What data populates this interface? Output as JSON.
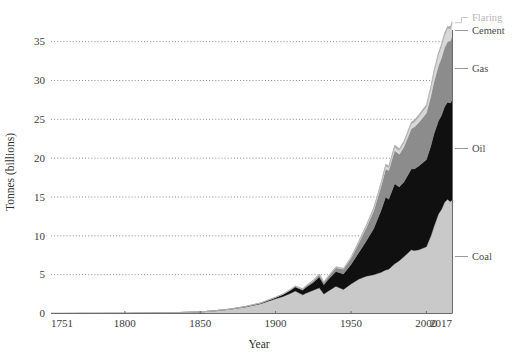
{
  "chart_data": {
    "type": "area",
    "title": "",
    "subtitle": "",
    "xlabel": "Year",
    "ylabel": "Tonnes (billions)",
    "stacked": true,
    "grid": true,
    "legend_position": "right-inline",
    "xlim": [
      1751,
      2017
    ],
    "ylim": [
      0,
      36.5
    ],
    "yticks": [
      0,
      5,
      10,
      15,
      20,
      25,
      30,
      35
    ],
    "ytick_labels": [
      "0",
      "5",
      "10",
      "15",
      "20",
      "25",
      "30",
      "35"
    ],
    "xticks": [
      1751,
      1800,
      1850,
      1900,
      1950,
      2000,
      2017
    ],
    "xtick_labels": [
      "1751",
      "1800",
      "1850",
      "1900",
      "1950",
      "2000",
      "2017"
    ],
    "colors": {
      "coal": "#c9c9c9",
      "oil": "#101010",
      "gas": "#8c8c8c",
      "cement": "#d8d8d8",
      "flaring": "#a8a8a8",
      "axis": "#6b6b6b",
      "grid": "#6f6f6f",
      "text": "#3a3a3a"
    },
    "x": [
      1751,
      1760,
      1770,
      1780,
      1790,
      1800,
      1810,
      1820,
      1830,
      1840,
      1850,
      1860,
      1870,
      1880,
      1890,
      1900,
      1905,
      1910,
      1913,
      1918,
      1920,
      1925,
      1929,
      1932,
      1935,
      1940,
      1945,
      1950,
      1955,
      1960,
      1965,
      1970,
      1973,
      1975,
      1979,
      1982,
      1985,
      1990,
      1992,
      1995,
      2000,
      2003,
      2005,
      2008,
      2010,
      2012,
      2014,
      2016,
      2017
    ],
    "series": [
      {
        "name": "Coal",
        "key": "coal",
        "values": [
          0.01,
          0.01,
          0.02,
          0.02,
          0.03,
          0.03,
          0.05,
          0.07,
          0.1,
          0.15,
          0.2,
          0.35,
          0.55,
          0.85,
          1.25,
          1.9,
          2.2,
          2.6,
          2.9,
          2.4,
          2.6,
          3.0,
          3.3,
          2.5,
          2.9,
          3.5,
          3.1,
          3.8,
          4.4,
          4.8,
          5.0,
          5.3,
          5.6,
          5.7,
          6.4,
          6.8,
          7.3,
          8.2,
          8.1,
          8.2,
          8.6,
          10.0,
          11.2,
          12.8,
          13.4,
          14.3,
          14.7,
          14.4,
          14.6
        ]
      },
      {
        "name": "Oil",
        "key": "oil",
        "values": [
          0,
          0,
          0,
          0,
          0,
          0,
          0,
          0,
          0,
          0,
          0,
          0.01,
          0.02,
          0.04,
          0.08,
          0.15,
          0.25,
          0.4,
          0.5,
          0.6,
          0.75,
          1.0,
          1.4,
          1.2,
          1.5,
          1.9,
          2.0,
          2.5,
          3.4,
          4.5,
          5.9,
          8.0,
          9.4,
          9.0,
          10.3,
          9.5,
          9.6,
          10.4,
          10.5,
          10.8,
          11.2,
          11.6,
          11.9,
          12.0,
          12.1,
          12.3,
          12.5,
          12.7,
          12.9
        ]
      },
      {
        "name": "Gas",
        "key": "gas",
        "values": [
          0,
          0,
          0,
          0,
          0,
          0,
          0,
          0,
          0,
          0,
          0,
          0,
          0,
          0.01,
          0.02,
          0.04,
          0.06,
          0.09,
          0.11,
          0.13,
          0.16,
          0.22,
          0.3,
          0.28,
          0.35,
          0.5,
          0.6,
          0.8,
          1.2,
          1.7,
          2.3,
          3.1,
          3.6,
          3.7,
          4.3,
          4.2,
          4.5,
          5.2,
          5.4,
          5.6,
          6.0,
          6.4,
          6.7,
          7.1,
          7.4,
          7.6,
          7.8,
          8.0,
          8.2
        ]
      },
      {
        "name": "Cement",
        "key": "cement",
        "values": [
          0,
          0,
          0,
          0,
          0,
          0,
          0,
          0,
          0,
          0,
          0,
          0,
          0,
          0,
          0.01,
          0.01,
          0.02,
          0.02,
          0.03,
          0.03,
          0.04,
          0.05,
          0.06,
          0.05,
          0.06,
          0.07,
          0.06,
          0.1,
          0.15,
          0.2,
          0.26,
          0.33,
          0.38,
          0.39,
          0.45,
          0.48,
          0.52,
          0.62,
          0.66,
          0.72,
          0.82,
          1.05,
          1.2,
          1.4,
          1.5,
          1.6,
          1.65,
          1.58,
          1.6
        ]
      },
      {
        "name": "Flaring",
        "key": "flaring",
        "values": [
          0,
          0,
          0,
          0,
          0,
          0,
          0,
          0,
          0,
          0,
          0,
          0,
          0,
          0,
          0,
          0.01,
          0.01,
          0.02,
          0.02,
          0.02,
          0.03,
          0.04,
          0.05,
          0.04,
          0.05,
          0.06,
          0.06,
          0.08,
          0.11,
          0.14,
          0.17,
          0.21,
          0.24,
          0.22,
          0.25,
          0.23,
          0.22,
          0.24,
          0.25,
          0.26,
          0.27,
          0.28,
          0.3,
          0.31,
          0.3,
          0.3,
          0.3,
          0.29,
          0.29
        ]
      }
    ],
    "legend_entries": [
      {
        "label": "Flaring",
        "faint": true
      },
      {
        "label": "Cement",
        "faint": false
      },
      {
        "label": "Gas",
        "faint": false
      },
      {
        "label": "Oil",
        "faint": false
      },
      {
        "label": "Coal",
        "faint": false
      }
    ]
  }
}
